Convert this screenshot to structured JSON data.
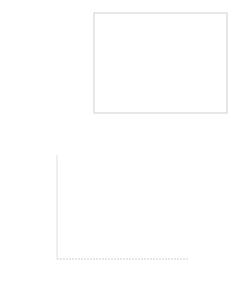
{
  "problem_label": "41.",
  "chart_data": [
    {
      "type": "line",
      "title": "",
      "xlabel": "",
      "ylabel": "",
      "xlim": [
        0,
        2
      ],
      "ylim": [
        0,
        14
      ],
      "xticks": [
        0,
        1,
        2
      ],
      "yticks": [
        0,
        5,
        10
      ],
      "xtick_labels": [
        "0",
        "1",
        "2"
      ],
      "ytick_labels": [
        "0",
        "5",
        "10"
      ],
      "grid": false,
      "frame": "box",
      "series": [
        {
          "name": "curve",
          "color": "#555555",
          "x": [
            0,
            0.25,
            0.5,
            0.75,
            1.0,
            1.25,
            1.5,
            1.75,
            2.0
          ],
          "y": [
            1.0,
            1.02,
            1.19,
            1.63,
            2.5,
            3.93,
            6.06,
            9.04,
            13.0
          ]
        }
      ]
    },
    {
      "type": "line",
      "title": "",
      "xlabel": "",
      "ylabel": "",
      "xlim": [
        0,
        12
      ],
      "ylim": [
        -1.5,
        2
      ],
      "xticks": [
        0,
        5,
        10
      ],
      "yticks": [
        -1,
        0,
        1,
        2
      ],
      "xtick_labels": [
        "0",
        "5",
        "10"
      ],
      "ytick_labels": [
        "-1",
        "0",
        "1",
        "2"
      ],
      "grid": false,
      "frame": "left-bottom",
      "series": [
        {
          "name": "light",
          "color": "#d0d0d0",
          "x": [
            0,
            0.8,
            1.7,
            2.6,
            3.5,
            4.5,
            5.4,
            6.2,
            7.0,
            7.8,
            8.7,
            9.5,
            10.3,
            11.0,
            11.6,
            12.0
          ],
          "y": [
            1.0,
            0.0,
            -0.6,
            -0.35,
            0.15,
            0.25,
            -0.2,
            -0.55,
            0.2,
            1.0,
            0.2,
            -1.4,
            0.3,
            1.8,
            0.6,
            -1.0
          ]
        },
        {
          "name": "curve-2",
          "color": "#aaaaaa",
          "x": [
            0,
            1,
            2,
            3,
            4,
            4.7,
            5.5,
            6.3,
            7.0,
            7.8,
            8.6,
            9.4,
            10.2,
            11.0,
            12.0
          ],
          "y": [
            1.0,
            0.7,
            0.4,
            0.18,
            0.1,
            0.15,
            0.02,
            0.0,
            0.05,
            0.1,
            0.03,
            0.0,
            0.05,
            0.1,
            0.0
          ]
        },
        {
          "name": "curve-3",
          "color": "#8a8a8a",
          "x": [
            0,
            1,
            2,
            3,
            4,
            4.7,
            5.5,
            6.3,
            7.0,
            7.8,
            8.6,
            9.4,
            10.2,
            11.0,
            12.0
          ],
          "y": [
            1.0,
            0.6,
            0.3,
            0.08,
            0.1,
            0.2,
            0.0,
            -0.05,
            0.05,
            0.15,
            0.0,
            -0.05,
            0.05,
            0.15,
            -0.05
          ]
        },
        {
          "name": "curve-4",
          "color": "#6a6a6a",
          "x": [
            0,
            1,
            2,
            3,
            4,
            4.7,
            5.5,
            6.3,
            7.0,
            7.8,
            8.6,
            9.4,
            10.2,
            11.0,
            12.0
          ],
          "y": [
            1.0,
            0.45,
            0.15,
            -0.08,
            0.1,
            0.22,
            -0.02,
            -0.12,
            0.05,
            0.18,
            -0.02,
            -0.12,
            0.05,
            0.18,
            -0.08
          ]
        },
        {
          "name": "curve-5",
          "color": "#333333",
          "x": [
            0,
            0.8,
            1.6,
            2.4,
            3.1,
            3.9,
            4.7,
            5.5,
            6.3,
            7.0,
            7.8,
            8.6,
            9.4,
            10.2,
            11.0,
            11.7,
            12.0
          ],
          "y": [
            1.0,
            0.3,
            -0.05,
            -0.2,
            -0.25,
            0.05,
            0.25,
            0.0,
            -0.2,
            0.05,
            0.25,
            0.0,
            -0.2,
            0.05,
            0.25,
            0.05,
            -0.1
          ]
        }
      ]
    }
  ]
}
